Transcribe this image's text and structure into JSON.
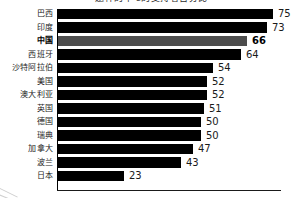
{
  "chart_data": {
    "type": "bar",
    "orientation": "horizontal",
    "title": "题件的下's的支持者百分比",
    "xlabel": "",
    "ylabel": "",
    "xlim": [
      0,
      75
    ],
    "grid": false,
    "legend": null,
    "highlight_category": "中国",
    "colors": {
      "bar": "#000000",
      "highlight_bar": "#4d4d4d",
      "text": "#1a1a1a",
      "axis": "#000000",
      "background": "#ffffff"
    },
    "categories": [
      "巴西",
      "印度",
      "中国",
      "西班牙",
      "沙特阿拉伯",
      "美国",
      "澳大利亚",
      "英国",
      "德国",
      "瑞典",
      "加拿大",
      "波兰",
      "日本"
    ],
    "values": [
      75,
      73,
      66,
      64,
      54,
      52,
      52,
      51,
      50,
      50,
      47,
      43,
      23
    ],
    "value_labels": [
      "75",
      "73",
      "66",
      "64",
      "54",
      "52",
      "52",
      "51",
      "50",
      "50",
      "47",
      "43",
      "23"
    ]
  }
}
